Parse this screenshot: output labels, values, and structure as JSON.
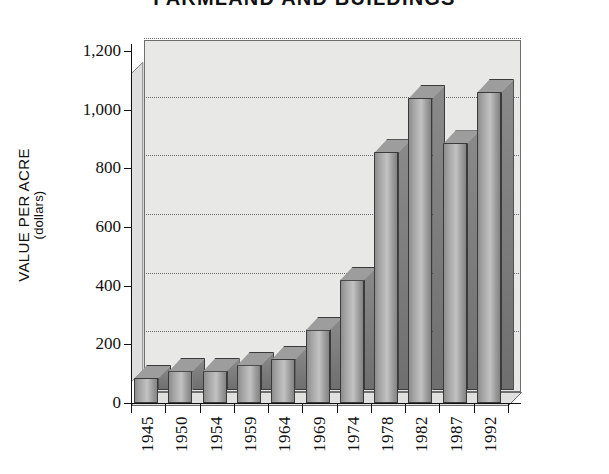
{
  "chart_data": {
    "type": "bar",
    "title": "FARMLAND AND BUILDINGS",
    "xlabel": "",
    "ylabel": "VALUE PER ACRE",
    "ylabel_sub": "(dollars)",
    "categories": [
      "1945",
      "1950",
      "1954",
      "1959",
      "1964",
      "1969",
      "1974",
      "1978",
      "1982",
      "1987",
      "1992"
    ],
    "values": [
      85,
      110,
      110,
      130,
      150,
      250,
      420,
      855,
      1040,
      885,
      1060
    ],
    "ylim": [
      0,
      1200
    ],
    "ytick_values": [
      0,
      200,
      400,
      600,
      800,
      1000,
      1200
    ],
    "ytick_labels": [
      "0",
      "200",
      "400",
      "600",
      "800",
      "1,000",
      "1,200"
    ],
    "grid": true,
    "grid_style": "dotted-horizontal",
    "legend": "none",
    "style": "3d-column",
    "colors": {
      "bar_fill": "#a8a8a8",
      "bar_edge": "#3a3a3a",
      "plot_background": "#e8e8e6",
      "axis": "#111111",
      "grid": "#6a6a6a",
      "text": "#111111"
    }
  }
}
